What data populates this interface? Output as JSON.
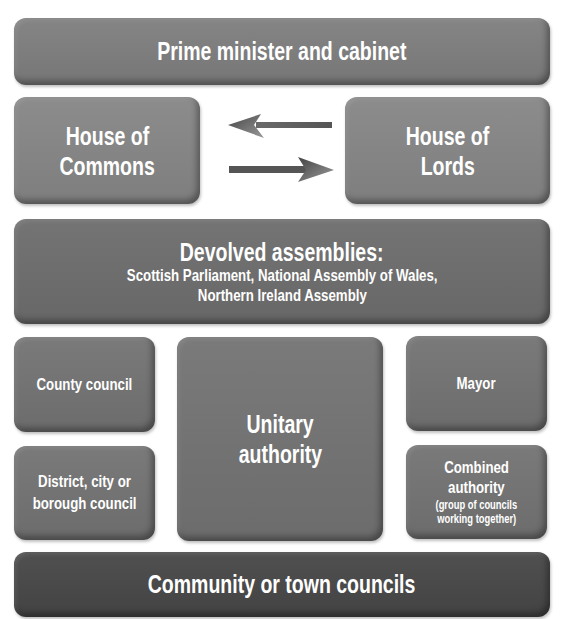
{
  "diagram": {
    "top": {
      "label": "Prime minister and cabinet"
    },
    "houses": {
      "commons": {
        "line1": "House of",
        "line2": "Commons"
      },
      "lords": {
        "line1": "House of",
        "line2": "Lords"
      },
      "arrows": [
        {
          "direction": "left",
          "from": "House of Lords",
          "to": "House of Commons"
        },
        {
          "direction": "right",
          "from": "House of Commons",
          "to": "House of Lords"
        }
      ]
    },
    "devolved": {
      "heading": "Devolved assemblies:",
      "line1": "Scottish Parliament, National Assembly of Wales,",
      "line2": "Northern Ireland Assembly"
    },
    "local": {
      "county": {
        "label": "County council"
      },
      "district": {
        "line1": "District, city or",
        "line2": "borough council"
      },
      "unitary": {
        "line1": "Unitary",
        "line2": "authority"
      },
      "mayor": {
        "label": "Mayor"
      },
      "combined": {
        "line1": "Combined",
        "line2": "authority",
        "note1": "(group of councils",
        "note2": "working together)"
      }
    },
    "bottom": {
      "label": "Community or town councils"
    },
    "colors": {
      "top": "#7d7d7d",
      "houses": "#858585",
      "devolved": "#6e6e6e",
      "local": "#737373",
      "community": "#4a4a4a",
      "text": "#ffffff"
    }
  }
}
